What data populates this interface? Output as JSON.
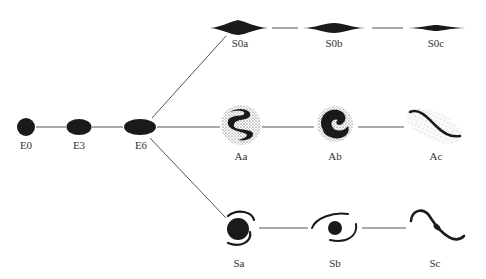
{
  "diagram": {
    "colors": {
      "ink": "#1a1a1a",
      "line": "#555555",
      "label": "#333333",
      "background": "#ffffff"
    },
    "elliptical": [
      {
        "label": "E0",
        "x": 26,
        "y": 127,
        "rx": 9,
        "ry": 9
      },
      {
        "label": "E3",
        "x": 79,
        "y": 127,
        "rx": 12,
        "ry": 8
      },
      {
        "label": "E6",
        "x": 140,
        "y": 127,
        "rx": 16,
        "ry": 8
      }
    ],
    "lenticular": [
      {
        "label": "S0a",
        "x": 238,
        "y": 28
      },
      {
        "label": "S0b",
        "x": 334,
        "y": 28
      },
      {
        "label": "S0c",
        "x": 436,
        "y": 28
      }
    ],
    "barred_spiral": [
      {
        "label": "Aa",
        "x": 241,
        "y": 125
      },
      {
        "label": "Ab",
        "x": 335,
        "y": 125
      },
      {
        "label": "Ac",
        "x": 434,
        "y": 125
      }
    ],
    "spiral": [
      {
        "label": "Sa",
        "x": 238,
        "y": 230
      },
      {
        "label": "Sb",
        "x": 334,
        "y": 230
      },
      {
        "label": "Sc",
        "x": 434,
        "y": 230
      }
    ]
  }
}
